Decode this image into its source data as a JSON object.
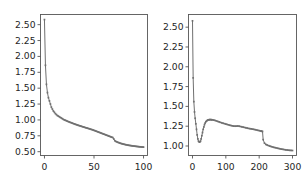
{
  "figure": {
    "background_color": "#ffffff",
    "line_color": "#707070",
    "marker_color": "#707070",
    "axes_color": "#555555",
    "tick_label_color": "#262626",
    "panel_count": 2
  },
  "chart_data": [
    {
      "type": "line",
      "panel": "left",
      "title": "",
      "xlabel": "",
      "ylabel": "",
      "xlim": [
        -4,
        104
      ],
      "ylim": [
        0.44,
        2.66
      ],
      "xticks": [
        0,
        50,
        100
      ],
      "xtick_labels": [
        "0",
        "50",
        "100"
      ],
      "yticks": [
        0.5,
        0.75,
        1.0,
        1.25,
        1.5,
        1.75,
        2.0,
        2.25,
        2.5
      ],
      "ytick_labels": [
        "0.50",
        "0.75",
        "1.00",
        "1.25",
        "1.50",
        "1.75",
        "2.00",
        "2.25",
        "2.50"
      ],
      "grid": false,
      "legend": null,
      "marker": "dot",
      "x": [
        0,
        1,
        2,
        3,
        4,
        5,
        6,
        7,
        8,
        9,
        10,
        11,
        12,
        13,
        14,
        15,
        16,
        17,
        18,
        19,
        20,
        21,
        22,
        23,
        24,
        25,
        26,
        27,
        28,
        29,
        30,
        31,
        32,
        33,
        34,
        35,
        36,
        37,
        38,
        39,
        40,
        41,
        42,
        43,
        44,
        45,
        46,
        47,
        48,
        49,
        50,
        51,
        52,
        53,
        54,
        55,
        56,
        57,
        58,
        59,
        60,
        61,
        62,
        63,
        64,
        65,
        66,
        67,
        68,
        69,
        70,
        71,
        72,
        73,
        74,
        75,
        76,
        77,
        78,
        79,
        80,
        81,
        82,
        83,
        84,
        85,
        86,
        87,
        88,
        89,
        90,
        91,
        92,
        93,
        94,
        95,
        96,
        97,
        98,
        99,
        100
      ],
      "y": [
        2.58,
        1.86,
        1.56,
        1.43,
        1.35,
        1.3,
        1.25,
        1.2,
        1.17,
        1.14,
        1.12,
        1.1,
        1.085,
        1.07,
        1.06,
        1.05,
        1.04,
        1.03,
        1.02,
        1.01,
        1.0,
        0.995,
        0.988,
        0.981,
        0.974,
        0.968,
        0.962,
        0.956,
        0.95,
        0.944,
        0.938,
        0.932,
        0.927,
        0.921,
        0.916,
        0.911,
        0.906,
        0.901,
        0.896,
        0.891,
        0.886,
        0.881,
        0.876,
        0.872,
        0.867,
        0.862,
        0.857,
        0.852,
        0.847,
        0.842,
        0.836,
        0.83,
        0.824,
        0.818,
        0.812,
        0.806,
        0.8,
        0.794,
        0.788,
        0.782,
        0.776,
        0.77,
        0.764,
        0.758,
        0.752,
        0.746,
        0.74,
        0.734,
        0.728,
        0.722,
        0.7,
        0.672,
        0.662,
        0.655,
        0.648,
        0.642,
        0.636,
        0.631,
        0.626,
        0.622,
        0.618,
        0.614,
        0.61,
        0.607,
        0.604,
        0.601,
        0.598,
        0.596,
        0.593,
        0.591,
        0.589,
        0.587,
        0.585,
        0.583,
        0.581,
        0.579,
        0.577,
        0.576,
        0.574,
        0.573,
        0.572
      ]
    },
    {
      "type": "line",
      "panel": "right",
      "title": "",
      "xlabel": "",
      "ylabel": "",
      "xlim": [
        -12,
        312
      ],
      "ylim": [
        0.88,
        2.66
      ],
      "xticks": [
        0,
        100,
        200,
        300
      ],
      "xtick_labels": [
        "0",
        "100",
        "200",
        "300"
      ],
      "yticks": [
        1.0,
        1.25,
        1.5,
        1.75,
        2.0,
        2.25,
        2.5
      ],
      "ytick_labels": [
        "1.00",
        "1.25",
        "1.50",
        "1.75",
        "2.00",
        "2.25",
        "2.50"
      ],
      "grid": false,
      "legend": null,
      "marker": "dot",
      "x": [
        0,
        2,
        4,
        6,
        8,
        10,
        12,
        14,
        16,
        18,
        20,
        22,
        24,
        26,
        28,
        30,
        32,
        34,
        36,
        38,
        40,
        42,
        44,
        46,
        48,
        50,
        52,
        54,
        56,
        58,
        60,
        64,
        68,
        72,
        76,
        80,
        84,
        88,
        92,
        96,
        100,
        104,
        108,
        112,
        116,
        120,
        124,
        128,
        132,
        136,
        140,
        144,
        148,
        152,
        156,
        160,
        164,
        168,
        172,
        176,
        180,
        184,
        188,
        192,
        196,
        200,
        204,
        206,
        208,
        210,
        212,
        216,
        220,
        224,
        228,
        232,
        236,
        240,
        244,
        248,
        252,
        256,
        260,
        264,
        268,
        272,
        276,
        280,
        284,
        288,
        292,
        296,
        300
      ],
      "y": [
        2.58,
        1.86,
        1.56,
        1.43,
        1.35,
        1.28,
        1.21,
        1.14,
        1.09,
        1.06,
        1.05,
        1.05,
        1.06,
        1.09,
        1.13,
        1.17,
        1.21,
        1.24,
        1.27,
        1.29,
        1.305,
        1.315,
        1.322,
        1.327,
        1.33,
        1.332,
        1.333,
        1.333,
        1.332,
        1.331,
        1.33,
        1.327,
        1.322,
        1.316,
        1.31,
        1.304,
        1.298,
        1.292,
        1.287,
        1.282,
        1.277,
        1.272,
        1.267,
        1.262,
        1.258,
        1.254,
        1.251,
        1.25,
        1.251,
        1.252,
        1.25,
        1.246,
        1.242,
        1.238,
        1.234,
        1.23,
        1.226,
        1.222,
        1.219,
        1.216,
        1.213,
        1.21,
        1.206,
        1.202,
        1.198,
        1.194,
        1.19,
        1.188,
        1.186,
        1.184,
        1.08,
        1.035,
        1.02,
        1.012,
        1.005,
        0.999,
        0.993,
        0.988,
        0.983,
        0.979,
        0.975,
        0.971,
        0.967,
        0.963,
        0.96,
        0.957,
        0.954,
        0.951,
        0.949,
        0.947,
        0.945,
        0.944,
        0.943
      ]
    }
  ]
}
